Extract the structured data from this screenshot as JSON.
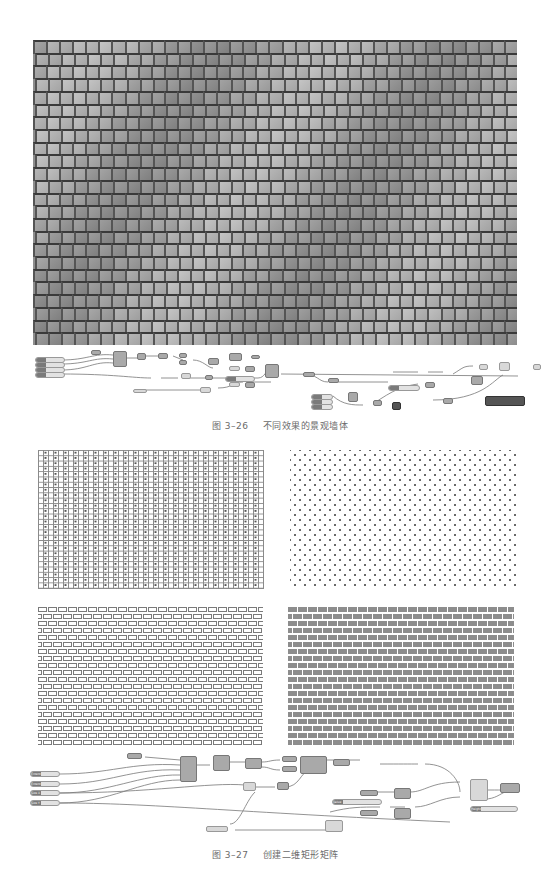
{
  "page": {
    "background": "#ffffff",
    "figures": [
      {
        "id": "fig-3-26",
        "number": "图 3–26",
        "title": "不同效果的景观墙体",
        "render_description": "grey rendered wall of offset rectangular blocks forming a wave pattern",
        "graph": {
          "input_sliders": 4,
          "description": "Grasshopper definition (node graph)"
        }
      },
      {
        "id": "fig-3-27",
        "number": "图 3–27",
        "title": "创建二维矩形矩阵",
        "panels": [
          {
            "name": "grid-with-crosses",
            "style": "outline grid with x marks"
          },
          {
            "name": "staggered-dots",
            "style": "staggered dot pattern"
          },
          {
            "name": "brick-outline",
            "style": "outlined brick bond"
          },
          {
            "name": "brick-filled",
            "style": "filled grey brick bond"
          }
        ],
        "graph": {
          "input_sliders": [
            {
              "label": "Extent X"
            },
            {
              "label": "Extent Y"
            },
            {
              "label": "Size X"
            },
            {
              "label": "Size Y"
            }
          ],
          "extra_sliders": [
            {
              "label": "Value"
            },
            {
              "label": "Height"
            }
          ],
          "description": "Grasshopper definition (node graph)"
        }
      }
    ],
    "colors": {
      "render_base": "#8e8e8e",
      "node": "#a9a9a9",
      "caption_text": "#6a6a6a",
      "brick_fill": "#8d8d8d"
    }
  }
}
